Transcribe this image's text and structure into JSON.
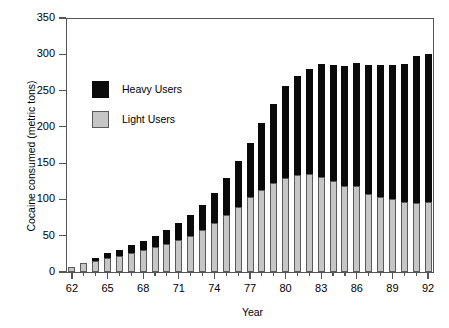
{
  "chart_data": {
    "type": "bar",
    "stacked": true,
    "title": "",
    "xlabel": "Year",
    "ylabel": "Cocaine consumed (metric tons)",
    "ylim": [
      0,
      350
    ],
    "ytick_values": [
      0,
      50,
      100,
      150,
      200,
      250,
      300,
      350
    ],
    "ytick_labels": [
      "0",
      "50",
      "100",
      "150",
      "200",
      "250",
      "300",
      "350"
    ],
    "grid": false,
    "legend_position": "upper-left-inside",
    "categories": [
      "62",
      "63",
      "64",
      "65",
      "66",
      "67",
      "68",
      "69",
      "70",
      "71",
      "72",
      "73",
      "74",
      "75",
      "76",
      "77",
      "78",
      "79",
      "80",
      "81",
      "82",
      "83",
      "84",
      "85",
      "86",
      "87",
      "88",
      "89",
      "90",
      "91",
      "92"
    ],
    "xtick_labels": [
      "62",
      "65",
      "68",
      "71",
      "74",
      "77",
      "80",
      "83",
      "86",
      "89",
      "92"
    ],
    "series": [
      {
        "name": "Light Users",
        "color": "#c6c6c6",
        "values": [
          7,
          12,
          15,
          19,
          22,
          26,
          30,
          34,
          38,
          44,
          50,
          58,
          67,
          78,
          90,
          103,
          113,
          122,
          130,
          133,
          135,
          131,
          125,
          118,
          118,
          108,
          103,
          100,
          96,
          95,
          96
        ]
      },
      {
        "name": "Heavy Users",
        "color": "#0a0a0a",
        "values": [
          0,
          0,
          5,
          7,
          9,
          11,
          13,
          16,
          20,
          24,
          29,
          35,
          42,
          52,
          63,
          75,
          92,
          110,
          127,
          137,
          145,
          155,
          160,
          166,
          170,
          177,
          182,
          185,
          190,
          202,
          204
        ]
      }
    ],
    "totals": [
      7,
      12,
      20,
      26,
      31,
      37,
      43,
      50,
      58,
      68,
      79,
      93,
      109,
      130,
      153,
      178,
      205,
      232,
      257,
      270,
      280,
      286,
      285,
      284,
      288,
      285,
      285,
      285,
      286,
      297,
      300
    ]
  },
  "legend": {
    "items": [
      {
        "label": "Heavy Users",
        "swatch": "heavy-users-swatch"
      },
      {
        "label": "Light Users",
        "swatch": "light-users-swatch"
      }
    ]
  }
}
